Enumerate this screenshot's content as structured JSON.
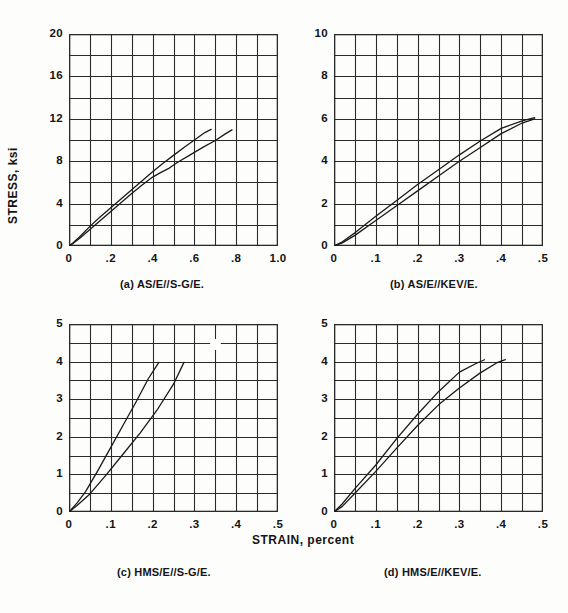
{
  "figure": {
    "y_axis_title": "STRESS, ksi",
    "x_axis_title": "STRAIN, percent",
    "background_color": "#fdfdfc",
    "line_color": "#1a1a1a",
    "grid_color": "#2a2a2a"
  },
  "chart_data": [
    {
      "id": "panel-a",
      "type": "line",
      "title": "(a) AS/E//S-G/E.",
      "caption_prefix": "(a)",
      "caption_name": "AS/E//S-G/E.",
      "xlabel": "STRAIN, percent",
      "ylabel": "STRESS, ksi",
      "xlim": [
        0,
        1.0
      ],
      "ylim": [
        0,
        20
      ],
      "xticks": [
        0,
        0.2,
        0.4,
        0.6,
        0.8,
        1.0
      ],
      "xticklabels": [
        "0",
        ".2",
        ".4",
        ".6",
        ".8",
        "1.0"
      ],
      "yticks": [
        0,
        4,
        8,
        12,
        16,
        20
      ],
      "yticklabels": [
        "0",
        "4",
        "8",
        "12",
        "16",
        "20"
      ],
      "x_minor_step": 0.1,
      "y_minor_step": 2,
      "grid": true,
      "legend": "none",
      "series": [
        {
          "name": "curve-1",
          "x": [
            0.0,
            0.02,
            0.05,
            0.1,
            0.15,
            0.2,
            0.25,
            0.3,
            0.35,
            0.4,
            0.45,
            0.5,
            0.55,
            0.6,
            0.65,
            0.68
          ],
          "y": [
            0.0,
            0.3,
            0.85,
            1.85,
            2.75,
            3.6,
            4.45,
            5.3,
            6.15,
            7.0,
            7.8,
            8.55,
            9.3,
            10.0,
            10.7,
            11.0
          ]
        },
        {
          "name": "curve-2",
          "x": [
            0.0,
            0.02,
            0.05,
            0.1,
            0.15,
            0.2,
            0.25,
            0.3,
            0.35,
            0.4,
            0.44,
            0.48,
            0.52,
            0.58,
            0.64,
            0.7,
            0.75,
            0.78
          ],
          "y": [
            0.0,
            0.25,
            0.7,
            1.55,
            2.4,
            3.25,
            4.1,
            4.95,
            5.75,
            6.5,
            6.95,
            7.35,
            7.9,
            8.6,
            9.3,
            9.95,
            10.6,
            10.95
          ]
        }
      ]
    },
    {
      "id": "panel-b",
      "type": "line",
      "title": "(b) AS/E//KEV/E.",
      "caption_prefix": "(b)",
      "caption_name": "AS/E//KEV/E.",
      "xlabel": "STRAIN, percent",
      "ylabel": "STRESS, ksi",
      "xlim": [
        0,
        0.5
      ],
      "ylim": [
        0,
        10
      ],
      "xticks": [
        0,
        0.1,
        0.2,
        0.3,
        0.4,
        0.5
      ],
      "xticklabels": [
        "0",
        ".1",
        ".2",
        ".3",
        ".4",
        ".5"
      ],
      "yticks": [
        0,
        2,
        4,
        6,
        8,
        10
      ],
      "yticklabels": [
        "0",
        "2",
        "4",
        "6",
        "8",
        "10"
      ],
      "x_minor_step": 0.05,
      "y_minor_step": 1,
      "grid": true,
      "legend": "none",
      "series": [
        {
          "name": "curve-1",
          "x": [
            0.0,
            0.02,
            0.05,
            0.1,
            0.15,
            0.2,
            0.25,
            0.3,
            0.35,
            0.4,
            0.45,
            0.48
          ],
          "y": [
            0.0,
            0.2,
            0.62,
            1.4,
            2.15,
            2.9,
            3.6,
            4.3,
            4.95,
            5.55,
            5.9,
            6.05
          ]
        },
        {
          "name": "curve-2",
          "x": [
            0.0,
            0.02,
            0.05,
            0.1,
            0.15,
            0.2,
            0.25,
            0.3,
            0.35,
            0.4,
            0.45,
            0.48
          ],
          "y": [
            0.0,
            0.15,
            0.5,
            1.2,
            1.9,
            2.6,
            3.3,
            4.0,
            4.65,
            5.3,
            5.8,
            6.0
          ]
        }
      ]
    },
    {
      "id": "panel-c",
      "type": "line",
      "title": "(c) HMS/E//S-G/E.",
      "caption_prefix": "(c)",
      "caption_name": "HMS/E//S-G/E.",
      "xlabel": "STRAIN, percent",
      "ylabel": "STRESS, ksi",
      "xlim": [
        0,
        0.5
      ],
      "ylim": [
        0,
        5
      ],
      "xticks": [
        0,
        0.1,
        0.2,
        0.3,
        0.4,
        0.5
      ],
      "xticklabels": [
        "0",
        ".1",
        ".2",
        ".3",
        ".4",
        ".5"
      ],
      "yticks": [
        0,
        1,
        2,
        3,
        4,
        5
      ],
      "yticklabels": [
        "0",
        "1",
        "2",
        "3",
        "4",
        "5"
      ],
      "x_minor_step": 0.05,
      "y_minor_step": 0.5,
      "grid": true,
      "legend": "none",
      "series": [
        {
          "name": "curve-1",
          "x": [
            0.0,
            0.02,
            0.04,
            0.07,
            0.1,
            0.13,
            0.16,
            0.19,
            0.215
          ],
          "y": [
            0.0,
            0.25,
            0.55,
            1.12,
            1.72,
            2.32,
            2.92,
            3.55,
            3.98
          ]
        },
        {
          "name": "curve-2",
          "x": [
            0.0,
            0.02,
            0.05,
            0.09,
            0.13,
            0.17,
            0.21,
            0.25,
            0.275
          ],
          "y": [
            0.0,
            0.18,
            0.48,
            1.0,
            1.55,
            2.1,
            2.7,
            3.4,
            3.98
          ]
        }
      ],
      "annotations": [
        {
          "name": "scan-artifact",
          "x": 0.35,
          "y": 4.48
        }
      ]
    },
    {
      "id": "panel-d",
      "type": "line",
      "title": "(d) HMS/E//KEV/E.",
      "caption_prefix": "(d)",
      "caption_name": "HMS/E//KEV/E.",
      "xlabel": "STRAIN, percent",
      "ylabel": "STRESS, ksi",
      "xlim": [
        0,
        0.5
      ],
      "ylim": [
        0,
        5
      ],
      "xticks": [
        0,
        0.1,
        0.2,
        0.3,
        0.4,
        0.5
      ],
      "xticklabels": [
        "0",
        ".1",
        ".2",
        ".3",
        ".4",
        ".5"
      ],
      "yticks": [
        0,
        1,
        2,
        3,
        4,
        5
      ],
      "yticklabels": [
        "0",
        "1",
        "2",
        "3",
        "4",
        "5"
      ],
      "x_minor_step": 0.05,
      "y_minor_step": 0.5,
      "grid": true,
      "legend": "none",
      "series": [
        {
          "name": "curve-1",
          "x": [
            0.0,
            0.02,
            0.05,
            0.1,
            0.15,
            0.2,
            0.25,
            0.3,
            0.34,
            0.36
          ],
          "y": [
            0.0,
            0.22,
            0.62,
            1.25,
            1.95,
            2.6,
            3.2,
            3.72,
            3.95,
            4.05
          ]
        },
        {
          "name": "curve-2",
          "x": [
            0.0,
            0.02,
            0.05,
            0.1,
            0.15,
            0.2,
            0.25,
            0.3,
            0.35,
            0.39,
            0.41
          ],
          "y": [
            0.0,
            0.15,
            0.5,
            1.08,
            1.7,
            2.3,
            2.85,
            3.3,
            3.7,
            3.97,
            4.05
          ]
        }
      ]
    }
  ]
}
